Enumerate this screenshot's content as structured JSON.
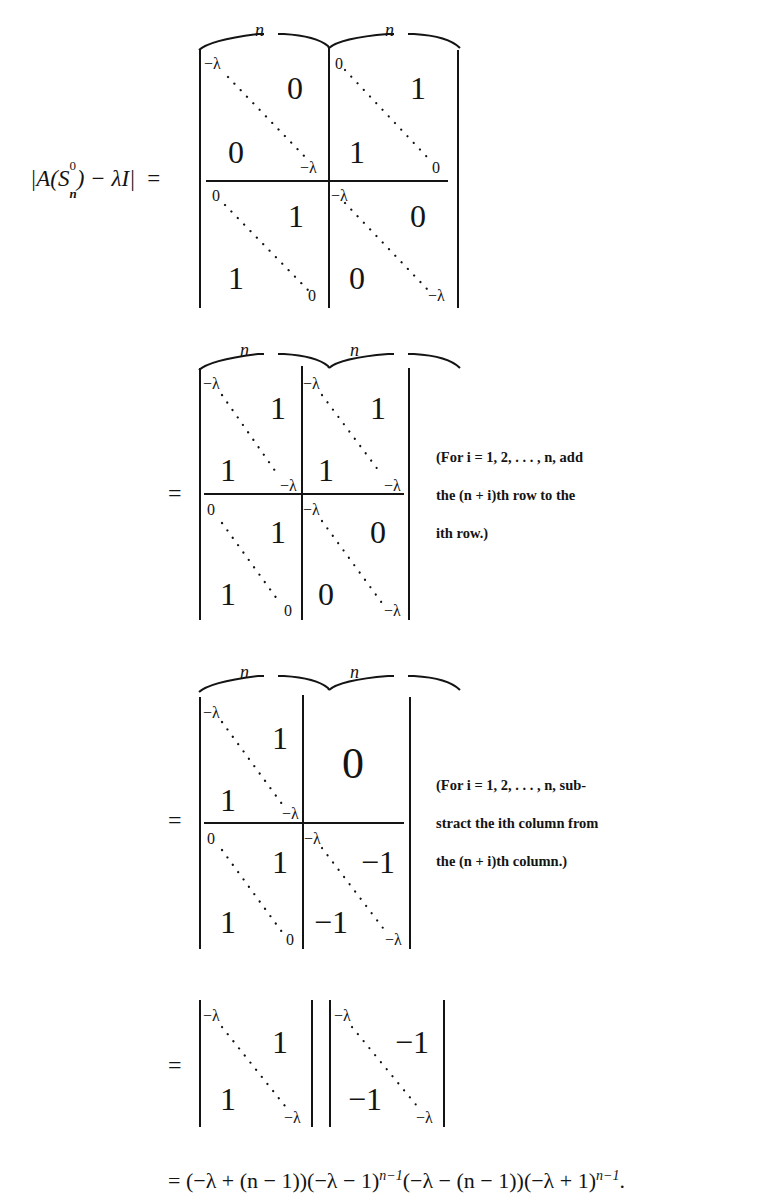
{
  "lhs": {
    "label_pre": "|A(S",
    "sup": "0",
    "sub": "n",
    "label_post": ") − λI|",
    "equals": "="
  },
  "brace_label": "n",
  "matrix1": {
    "top_left": {
      "diag_start": "−λ",
      "diag_end": "−λ",
      "upper": "0",
      "lower": "0"
    },
    "top_right": {
      "diag_start": "0",
      "diag_end": "0",
      "upper": "1",
      "lower": "1"
    },
    "bottom_left": {
      "diag_start": "0",
      "diag_end": "0",
      "upper": "1",
      "lower": "1"
    },
    "bottom_right": {
      "diag_start": "−λ",
      "diag_end": "−λ",
      "upper": "0",
      "lower": "0"
    }
  },
  "matrix2": {
    "equals": "=",
    "top_left": {
      "diag_start": "−λ",
      "diag_end": "−λ",
      "upper": "1",
      "lower": "1"
    },
    "top_right": {
      "diag_start": "−λ",
      "diag_end": "−λ",
      "upper": "1",
      "lower": "1"
    },
    "bottom_left": {
      "diag_start": "0",
      "diag_end": "0",
      "upper": "1",
      "lower": "1"
    },
    "bottom_right": {
      "diag_start": "−λ",
      "diag_end": "−λ",
      "upper": "0",
      "lower": "0"
    },
    "note": [
      "(For i = 1, 2, . . . , n, add",
      "the (n + i)th row to the",
      "ith row.)"
    ]
  },
  "matrix3": {
    "equals": "=",
    "top_left": {
      "diag_start": "−λ",
      "diag_end": "−λ",
      "upper": "1",
      "lower": "1"
    },
    "top_right": {
      "block": "0"
    },
    "bottom_left": {
      "diag_start": "0",
      "diag_end": "0",
      "upper": "1",
      "lower": "1"
    },
    "bottom_right": {
      "diag_start": "−λ",
      "diag_end": "−λ",
      "upper": "−1",
      "lower": "−1"
    },
    "note": [
      "(For i = 1, 2, . . . , n, sub-",
      "stract the ith column from",
      "the (n + i)th column.)"
    ]
  },
  "matrix4": {
    "equals": "=",
    "left": {
      "diag_start": "−λ",
      "diag_end": "−λ",
      "upper": "1",
      "lower": "1"
    },
    "right": {
      "diag_start": "−λ",
      "diag_end": "−λ",
      "upper": "−1",
      "lower": "−1"
    }
  },
  "final": {
    "text": "= (−λ + (n − 1))(−λ − 1)",
    "exp1": "n−1",
    "mid": "(−λ − (n − 1))(−λ + 1)",
    "exp2": "n−1",
    "end": "."
  }
}
